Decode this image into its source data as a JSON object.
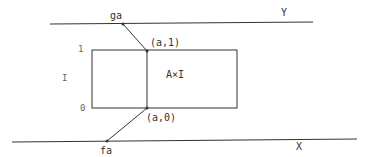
{
  "diagram": {
    "top_space_label": "Y",
    "bottom_space_label": "X",
    "top_point_label": "ga",
    "bottom_point_label": "fa",
    "rect_label": "A×I",
    "interval_label": "I",
    "interval_top_label": "1",
    "interval_bottom_label": "0",
    "corner_top_label": "(a,1)",
    "corner_bottom_label": "(a,0)"
  },
  "colors": {
    "stroke": "#333333",
    "background": "#ffffff"
  }
}
